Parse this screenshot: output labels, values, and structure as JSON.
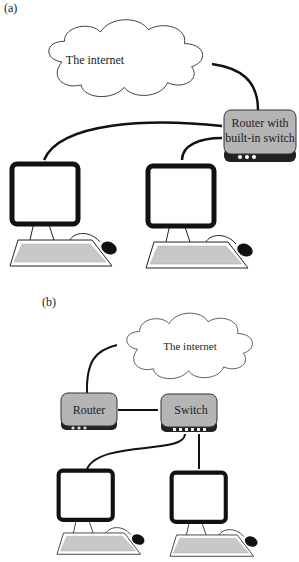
{
  "panel_a": {
    "label": "(a)",
    "cloud_label": "The internet",
    "router_label_line1": "Router with",
    "router_label_line2": "built-in switch",
    "computers": 2
  },
  "panel_b": {
    "label": "(b)",
    "cloud_label": "The internet",
    "router_label": "Router",
    "switch_label": "Switch",
    "computers": 2
  },
  "colors": {
    "device_fill": "#b5b5b5",
    "device_base": "#222222",
    "keyboard_fill": "#c8c8c8",
    "line": "#111111"
  }
}
